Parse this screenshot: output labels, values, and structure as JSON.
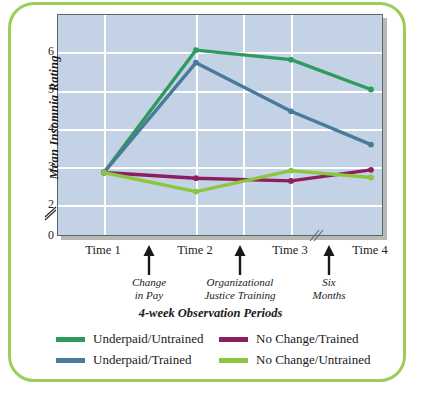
{
  "chart_data": {
    "type": "line",
    "title": "",
    "xlabel": "4-week Observation Periods",
    "ylabel": "Mean Insomnia Rating",
    "categories": [
      "Time 1",
      "Time 2",
      "Time 3",
      "Time 4"
    ],
    "ylim": [
      0,
      6.6
    ],
    "y_ticks": [
      "0",
      "2",
      "3",
      "4",
      "5",
      "6"
    ],
    "y_axis_break": true,
    "x_axis_break": true,
    "grid": true,
    "legend_position": "bottom",
    "series": [
      {
        "name": "Underpaid/Untrained",
        "color": "#2e9a5e",
        "values": [
          2.85,
          6.05,
          5.8,
          5.02
        ]
      },
      {
        "name": "Underpaid/Trained",
        "color": "#4a7a99",
        "values": [
          2.85,
          5.72,
          4.45,
          3.58
        ]
      },
      {
        "name": "No Change/Trained",
        "color": "#8e1f5e",
        "values": [
          2.85,
          2.7,
          2.63,
          2.92
        ]
      },
      {
        "name": "No Change/Untrained",
        "color": "#8cc63f",
        "values": [
          2.85,
          2.35,
          2.9,
          2.72
        ]
      }
    ],
    "annotations": [
      {
        "label_line1": "Change",
        "label_line2": "in Pay",
        "x_position": 0.5
      },
      {
        "label_line1": "Organizational",
        "label_line2": "Justice Training",
        "x_position": 1.5
      },
      {
        "label_line1": "Six",
        "label_line2": "Months",
        "x_position": 2.5
      }
    ],
    "colors": {
      "plot_background": "#c3d2e5",
      "gridline": "#ffffff",
      "frame_border": "#9ccd5a",
      "axis": "#5c6470"
    }
  }
}
